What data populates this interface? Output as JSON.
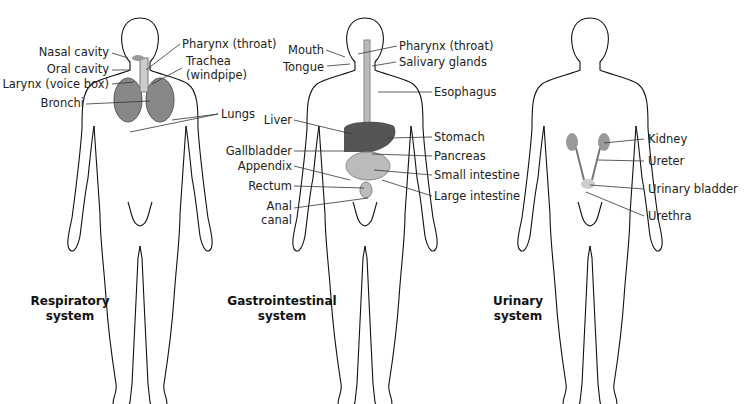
{
  "figure": {
    "panels": [
      {
        "id": "respiratory",
        "title_line1": "Respiratory",
        "title_line2": "system",
        "labels": [
          "Nasal cavity",
          "Oral cavity",
          "Larynx (voice box)",
          "Bronchi",
          "Pharynx (throat)",
          "Trachea",
          "(windpipe)",
          "Lungs"
        ]
      },
      {
        "id": "gastrointestinal",
        "title_line1": "Gastrointestinal",
        "title_line2": "system",
        "labels": [
          "Mouth",
          "Tongue",
          "Liver",
          "Gallbladder",
          "Appendix",
          "Rectum",
          "Anal",
          "canal",
          "Pharynx (throat)",
          "Salivary glands",
          "Esophagus",
          "Stomach",
          "Pancreas",
          "Small intestine",
          "Large intestine"
        ]
      },
      {
        "id": "urinary",
        "title_line1": "Urinary",
        "title_line2": "system",
        "labels": [
          "Kidney",
          "Ureter",
          "Urinary bladder",
          "Urethra"
        ]
      }
    ]
  }
}
